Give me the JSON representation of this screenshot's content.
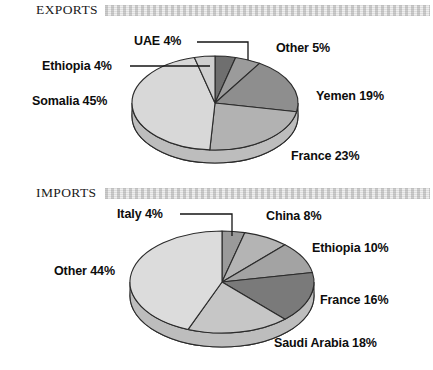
{
  "chart_data": [
    {
      "type": "pie",
      "title": "EXPORTS",
      "chart_id": "exports",
      "xlabel": "",
      "ylabel": "",
      "legend_position": "callout-labels",
      "grid": false,
      "units": "percent",
      "categories": [
        "UAE",
        "Other",
        "Yemen",
        "France",
        "Somalia",
        "Ethiopia"
      ],
      "values": [
        4,
        5,
        19,
        23,
        45,
        4
      ],
      "labels": [
        "UAE 4%",
        "Other 5%",
        "Yemen 19%",
        "France 23%",
        "Somalia 45%",
        "Ethiopia 4%"
      ],
      "slice_colors": [
        "#6f6f6f",
        "#9b9b9b",
        "#8e8e8e",
        "#b2b2b2",
        "#d8d8d8",
        "#cfcfcf"
      ]
    },
    {
      "type": "pie",
      "title": "IMPORTS",
      "chart_id": "imports",
      "xlabel": "",
      "ylabel": "",
      "legend_position": "callout-labels",
      "grid": false,
      "units": "percent",
      "categories": [
        "Italy",
        "China",
        "Ethiopia",
        "France",
        "Saudi Arabia",
        "Other"
      ],
      "values": [
        4,
        8,
        10,
        16,
        18,
        44
      ],
      "labels": [
        "Italy 4%",
        "China 8%",
        "Ethiopia 10%",
        "France 16%",
        "Saudi Arabia 18%",
        "Other 44%"
      ],
      "slice_colors": [
        "#9a9a9a",
        "#b4b4b4",
        "#a3a3a3",
        "#7a7a7a",
        "#c6c6c6",
        "#dcdcdc"
      ]
    }
  ],
  "exports": {
    "header": {
      "title": "EXPORTS"
    },
    "labels": {
      "uae": "UAE 4%",
      "ethiopia": "Ethiopia 4%",
      "somalia": "Somalia 45%",
      "other": "Other 5%",
      "yemen": "Yemen 19%",
      "france": "France 23%"
    }
  },
  "imports": {
    "header": {
      "title": "IMPORTS"
    },
    "labels": {
      "italy": "Italy 4%",
      "other": "Other 44%",
      "china": "China 8%",
      "ethiopia": "Ethiopia 10%",
      "france": "France 16%",
      "saudi_arabia": "Saudi Arabia 18%"
    }
  },
  "colors": {
    "text": "#0d0d0d",
    "header_bar": "#c9c9c9",
    "pie_darkest": "#6f6f6f",
    "pie_lightest": "#dcdcdc",
    "outline": "#2b2b2b"
  }
}
